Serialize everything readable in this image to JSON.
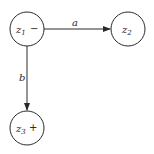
{
  "diagram": {
    "type": "state-diagram",
    "states": [
      {
        "id": "z1",
        "base": "z",
        "sub": "1",
        "marker": "−",
        "role": "start",
        "cx": 27,
        "cy": 29
      },
      {
        "id": "z2",
        "base": "z",
        "sub": "2",
        "marker": "",
        "role": "normal",
        "cx": 128,
        "cy": 29
      },
      {
        "id": "z3",
        "base": "z",
        "sub": "3",
        "marker": "+",
        "role": "final",
        "cx": 27,
        "cy": 128
      }
    ],
    "transitions": [
      {
        "from": "z1",
        "to": "z2",
        "label": "a"
      },
      {
        "from": "z1",
        "to": "z3",
        "label": "b"
      }
    ],
    "colors": {
      "stroke": "#2a2a2a",
      "background": "#ffffff"
    }
  }
}
